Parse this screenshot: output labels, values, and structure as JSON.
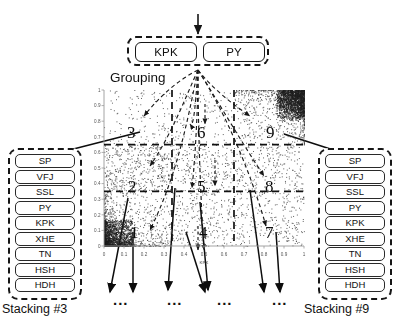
{
  "diagram": {
    "grouping": {
      "label": "Grouping",
      "features": [
        "KPK",
        "PY"
      ],
      "input_arrow": "down-arrow-icon"
    },
    "stacking_panels": [
      {
        "caption": "Stacking #3",
        "items": [
          "SP",
          "VFJ",
          "SSL",
          "PY",
          "KPK",
          "XHE",
          "TN",
          "HSH",
          "HDH"
        ]
      },
      {
        "caption": "Stacking #9",
        "items": [
          "SP",
          "VFJ",
          "SSL",
          "PY",
          "KPK",
          "XHE",
          "TN",
          "HSH",
          "HDH"
        ]
      }
    ],
    "cell_numbers": [
      "1",
      "2",
      "3",
      "4",
      "5",
      "6",
      "7",
      "8",
      "9"
    ],
    "ellipses": [
      "...",
      "...",
      "...",
      "..."
    ],
    "colors": {
      "ink": "#111111",
      "line": "#161616",
      "point": "#3a3a3a",
      "background": "#ffffff"
    }
  },
  "chart_data": {
    "type": "scatter",
    "title": "",
    "xlabel": "KPK",
    "ylabel": "",
    "xlim": [
      0,
      1
    ],
    "ylim": [
      0,
      1
    ],
    "xticks": [
      "0",
      "0.1",
      "0.2",
      "0.3",
      "0.4",
      "0.5",
      "0.6",
      "0.7",
      "0.8",
      "0.9",
      "1"
    ],
    "yticks": [
      "0",
      "0.1",
      "0.2",
      "0.3",
      "0.4",
      "0.5",
      "0.6",
      "0.7",
      "0.8",
      "0.9",
      "1"
    ],
    "grid": false,
    "legend": "none",
    "partition_lines": {
      "vertical": [
        0.34,
        0.65
      ],
      "horizontal": [
        0.35,
        0.65
      ],
      "style": "dashed"
    },
    "regions": [
      {
        "id": "1",
        "x_range": [
          0.0,
          0.34
        ],
        "y_range": [
          0.0,
          0.35
        ],
        "density": "very-high"
      },
      {
        "id": "2",
        "x_range": [
          0.0,
          0.34
        ],
        "y_range": [
          0.35,
          0.65
        ],
        "density": "high"
      },
      {
        "id": "3",
        "x_range": [
          0.0,
          0.34
        ],
        "y_range": [
          0.65,
          1.0
        ],
        "density": "low"
      },
      {
        "id": "4",
        "x_range": [
          0.34,
          0.65
        ],
        "y_range": [
          0.0,
          0.35
        ],
        "density": "medium"
      },
      {
        "id": "5",
        "x_range": [
          0.34,
          0.65
        ],
        "y_range": [
          0.35,
          0.65
        ],
        "density": "medium"
      },
      {
        "id": "6",
        "x_range": [
          0.34,
          0.65
        ],
        "y_range": [
          0.65,
          1.0
        ],
        "density": "low"
      },
      {
        "id": "7",
        "x_range": [
          0.65,
          1.0
        ],
        "y_range": [
          0.0,
          0.35
        ],
        "density": "medium"
      },
      {
        "id": "8",
        "x_range": [
          0.65,
          1.0
        ],
        "y_range": [
          0.35,
          0.65
        ],
        "density": "medium"
      },
      {
        "id": "9",
        "x_range": [
          0.65,
          1.0
        ],
        "y_range": [
          0.65,
          1.0
        ],
        "density": "very-high"
      }
    ],
    "point_count_approx": 4200
  }
}
